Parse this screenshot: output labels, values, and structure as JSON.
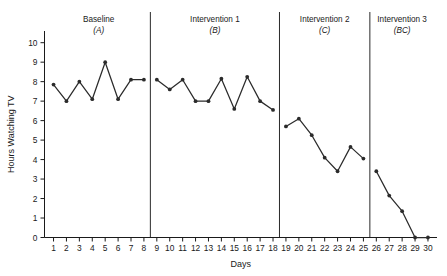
{
  "chart_data": {
    "type": "line",
    "title": "",
    "xlabel": "Days",
    "ylabel": "Hours Watching TV",
    "xlim": [
      0.3,
      30.7
    ],
    "ylim": [
      0,
      10.6
    ],
    "grid": false,
    "legend": "none",
    "x": [
      1,
      2,
      3,
      4,
      5,
      6,
      7,
      8,
      9,
      10,
      11,
      12,
      13,
      14,
      15,
      16,
      17,
      18,
      19,
      20,
      21,
      22,
      23,
      24,
      25,
      26,
      27,
      28,
      29,
      30
    ],
    "xtick_labels": [
      "1",
      "2",
      "3",
      "4",
      "5",
      "6",
      "7",
      "8",
      "9",
      "10",
      "11",
      "12",
      "13",
      "14",
      "15",
      "16",
      "17",
      "18",
      "19",
      "20",
      "21",
      "22",
      "23",
      "24",
      "25",
      "26",
      "27",
      "28",
      "29",
      "30"
    ],
    "ytick_labels": [
      "0",
      "1",
      "2",
      "3",
      "4",
      "5",
      "6",
      "7",
      "8",
      "9",
      "10"
    ],
    "ytick_values": [
      0,
      1,
      2,
      3,
      4,
      5,
      6,
      7,
      8,
      9,
      10
    ],
    "series": [
      {
        "name": "Hours Watching TV",
        "color": "#2b2b2b",
        "values": [
          7.85,
          7.0,
          8.0,
          7.1,
          9.0,
          7.1,
          8.1,
          8.1,
          8.1,
          7.6,
          8.1,
          7.0,
          7.0,
          8.15,
          6.6,
          8.25,
          7.0,
          6.55,
          5.7,
          6.1,
          5.25,
          4.1,
          3.4,
          4.65,
          4.05,
          3.4,
          2.15,
          1.35,
          0.0,
          0.0
        ]
      }
    ],
    "phases": [
      {
        "title": "Baseline",
        "sub": "(A)",
        "start_day": 1,
        "end_day": 8
      },
      {
        "title": "Intervention 1",
        "sub": "(B)",
        "start_day": 9,
        "end_day": 18
      },
      {
        "title": "Intervention 2",
        "sub": "(C)",
        "start_day": 19,
        "end_day": 25
      },
      {
        "title": "Intervention 3",
        "sub": "(BC)",
        "start_day": 26,
        "end_day": 30
      }
    ],
    "phase_dividers": [
      8.5,
      18.5,
      25.5
    ]
  }
}
